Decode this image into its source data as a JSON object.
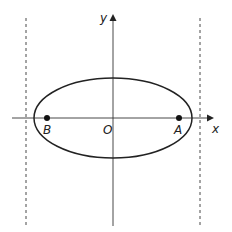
{
  "figure": {
    "type": "ellipse-diagram",
    "axes": {
      "x_label": "x",
      "y_label": "y",
      "origin_label": "O"
    },
    "points": [
      {
        "label": "A",
        "position": "right focus"
      },
      {
        "label": "B",
        "position": "left focus"
      }
    ],
    "dashed_lines": [
      "left directrix",
      "right directrix"
    ],
    "colors": {
      "stroke": "#222222",
      "background": "#ffffff"
    }
  }
}
